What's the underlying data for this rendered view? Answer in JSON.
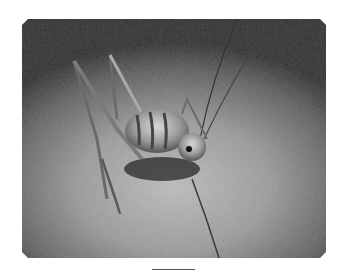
{
  "image": {
    "subject": "cave cricket on sand",
    "description": "Grayscale photograph of a long-legged, banded cricket standing on sandy ground at night, with long antennae",
    "scale_bar": true,
    "colors": {
      "background": "#ffffff",
      "photo_dark": "#2e2e2e",
      "photo_mid": "#9a9a9a",
      "photo_light": "#bdbdbd",
      "scale_bar": "#555555"
    }
  }
}
